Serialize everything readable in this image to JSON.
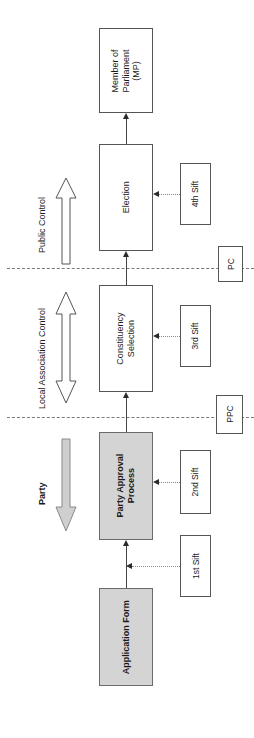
{
  "diagram": {
    "colors": {
      "shaded_fill": "#d4d4d4",
      "box_stroke": "#555555",
      "divider": "#7a7a7a",
      "connector": "#444444",
      "feeder": "#8a8a8a",
      "text": "#1a1a1a",
      "background": "#ffffff"
    },
    "stages": [
      {
        "id": "mp",
        "label": "Member of\nParliament\n(MP)",
        "line1": "Member of",
        "line2": "Parliament",
        "line3": "(MP)",
        "shaded": false
      },
      {
        "id": "election",
        "label": "Election",
        "line1": "Election",
        "line2": "",
        "line3": "",
        "shaded": false
      },
      {
        "id": "constituency",
        "label": "Constituency\nSelection",
        "line1": "Constituency",
        "line2": "Selection",
        "line3": "",
        "shaded": false
      },
      {
        "id": "party-approval",
        "label": "Party Approval\nProcess",
        "line1": "Party Approval",
        "line2": "Process",
        "line3": "",
        "shaded": true
      },
      {
        "id": "application",
        "label": "Application Form",
        "line1": "Application Form",
        "line2": "",
        "line3": "",
        "shaded": true
      }
    ],
    "sifts": [
      {
        "id": "sift4",
        "label": "4th Sift"
      },
      {
        "id": "sift3",
        "label": "3rd Sift"
      },
      {
        "id": "sift2",
        "label": "2nd Sift"
      },
      {
        "id": "sift1",
        "label": "1st Sift"
      }
    ],
    "status_tags": [
      {
        "id": "pc",
        "label": "PC"
      },
      {
        "id": "ppc",
        "label": "PPC"
      }
    ],
    "control_bands": [
      {
        "id": "public",
        "label": "Public Control",
        "arrow": "up",
        "style": "outline",
        "bold": false
      },
      {
        "id": "local",
        "label": "Local Association Control",
        "arrow": "updown",
        "style": "outline",
        "bold": false
      },
      {
        "id": "party",
        "label": "Party",
        "arrow": "down",
        "style": "filled",
        "bold": true
      }
    ]
  }
}
